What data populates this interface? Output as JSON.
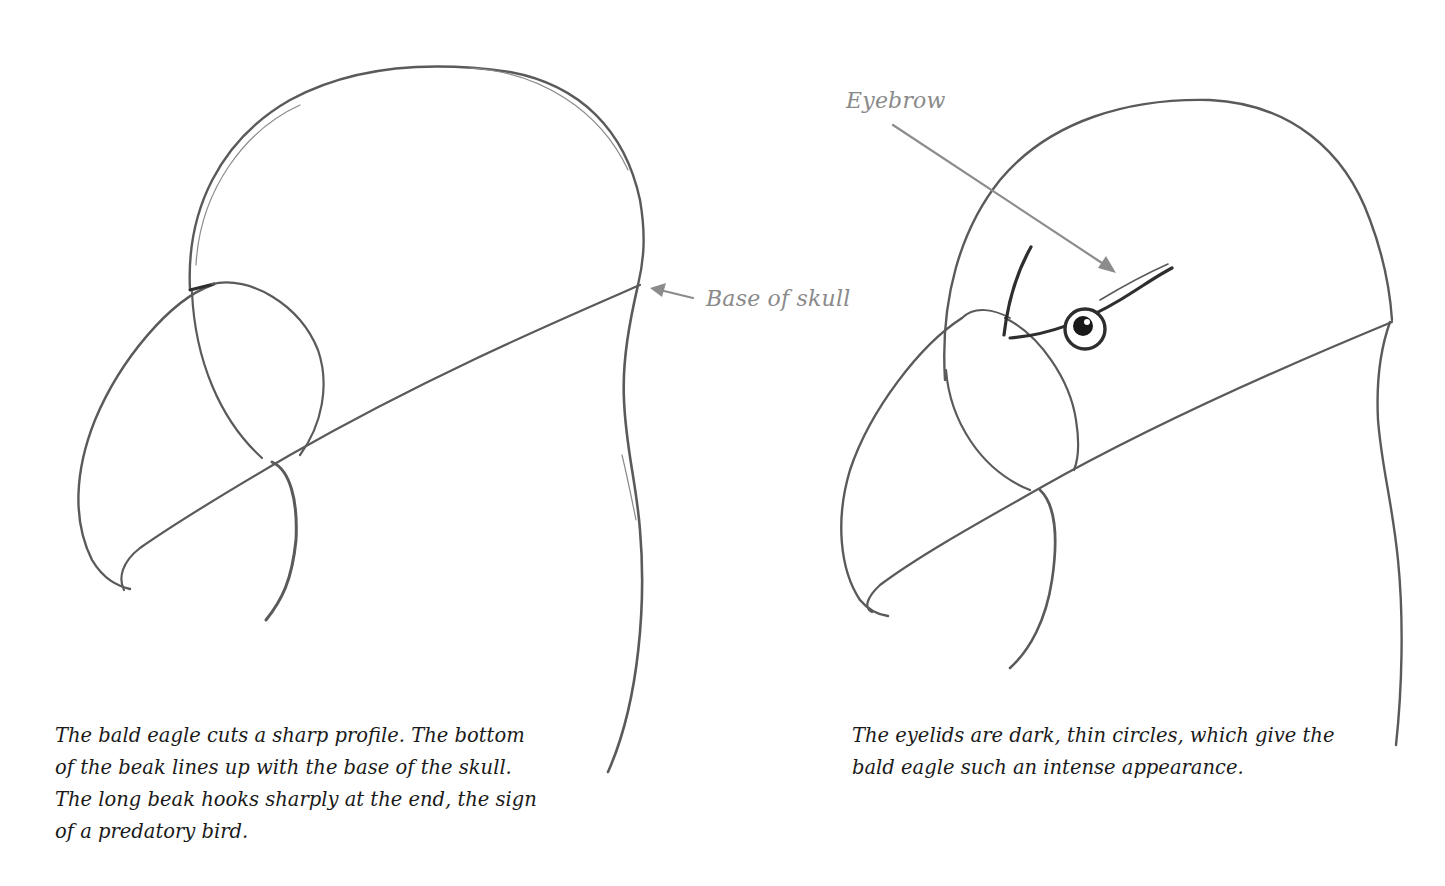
{
  "figure_left": {
    "title": "Bald eagle head construction - step 1",
    "annotation": "Base of skull",
    "caption_lines": [
      "The bald eagle cuts a sharp profile. The bottom",
      "of the beak lines up with the base of the skull.",
      "The long beak hooks sharply at the end, the sign",
      "of a predatory bird."
    ]
  },
  "figure_right": {
    "title": "Bald eagle head construction - step 2",
    "annotation": "Eyebrow",
    "caption_lines": [
      "The eyelids are dark, thin circles, which give the",
      "bald eagle such an intense appearance."
    ]
  },
  "colors": {
    "pencil": "#5a5a5a",
    "annotation": "#8a8a8a",
    "caption": "#1a1a1a",
    "background": "#ffffff"
  }
}
